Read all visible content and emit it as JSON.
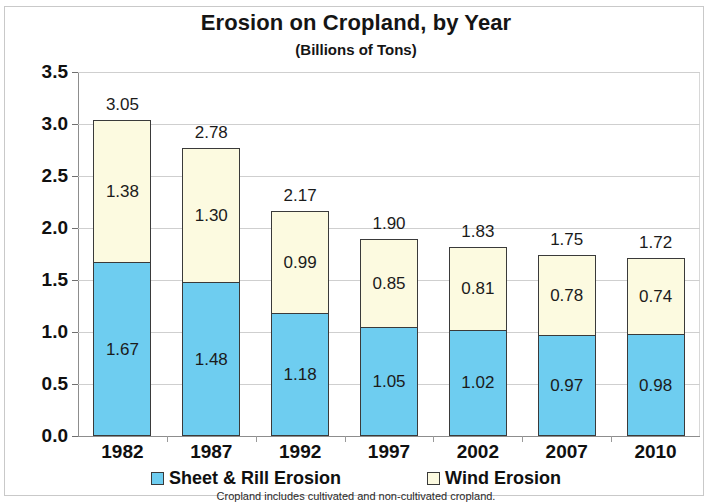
{
  "chart_data": {
    "type": "bar",
    "subtype": "stacked-column",
    "title": "Erosion on Cropland, by Year",
    "subtitle": "(Billions of Tons)",
    "footnote": "Cropland includes cultivated and non-cultivated cropland.",
    "xlabel": "",
    "ylabel": "",
    "ylim": [
      0,
      3.5
    ],
    "ytick_step": 0.5,
    "yticks": [
      "0.0",
      "0.5",
      "1.0",
      "1.5",
      "2.0",
      "2.5",
      "3.0",
      "3.5"
    ],
    "ytick_values": [
      0.0,
      0.5,
      1.0,
      1.5,
      2.0,
      2.5,
      3.0,
      3.5
    ],
    "grid": true,
    "legend_position": "bottom",
    "categories": [
      "1982",
      "1987",
      "1992",
      "1997",
      "2002",
      "2007",
      "2010"
    ],
    "series": [
      {
        "name": "Sheet & Rill Erosion",
        "color": "#6ECDF0",
        "values": [
          1.67,
          1.48,
          1.18,
          1.05,
          1.02,
          0.97,
          0.98
        ],
        "labels": [
          "1.67",
          "1.48",
          "1.18",
          "1.05",
          "1.02",
          "0.97",
          "0.98"
        ]
      },
      {
        "name": "Wind Erosion",
        "color": "#FCFAE0",
        "values": [
          1.38,
          1.3,
          0.99,
          0.85,
          0.81,
          0.78,
          0.74
        ],
        "labels": [
          "1.38",
          "1.30",
          "0.99",
          "0.85",
          "0.81",
          "0.78",
          "0.74"
        ]
      }
    ],
    "totals": [
      3.05,
      2.78,
      2.17,
      1.9,
      1.83,
      1.75,
      1.72
    ],
    "total_labels": [
      "3.05",
      "2.78",
      "2.17",
      "1.90",
      "1.83",
      "1.75",
      "1.72"
    ]
  },
  "legend": [
    {
      "label": "Sheet & Rill Erosion",
      "color": "#6ECDF0"
    },
    {
      "label": "Wind Erosion",
      "color": "#FCFAE0"
    }
  ],
  "colors": {
    "sheet_rill": "#6ECDF0",
    "wind": "#FCFAE0",
    "bar_border": "#3a3a3a",
    "grid": "#cfcfcf",
    "axis": "#8d8d8d",
    "text": "#101010",
    "frame": "#c9c9c9"
  }
}
